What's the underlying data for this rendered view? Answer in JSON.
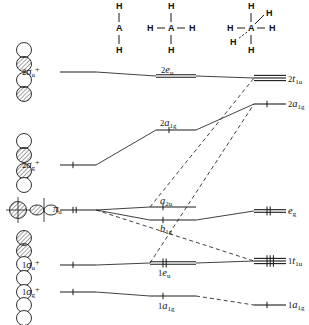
{
  "figure": {
    "type": "molecular-orbital-correlation-diagram"
  },
  "structures": [
    {
      "name": "linear-ah2",
      "center_atom": "A",
      "ligand": "H",
      "atoms": [
        "H",
        "A",
        "H"
      ],
      "x": 119,
      "y": 6,
      "geometry": "linear"
    },
    {
      "name": "square-planar-ah4",
      "center_atom": "A",
      "ligand": "H",
      "atoms": [
        "H",
        "H",
        "A",
        "H",
        "H"
      ],
      "x": 171,
      "y": 6,
      "geometry": "square-planar"
    },
    {
      "name": "tetrahedral-ah4",
      "center_atom": "A",
      "ligand": "H",
      "atoms": [
        "H",
        "H",
        "A",
        "H",
        "H"
      ],
      "x": 251,
      "y": 6,
      "geometry": "tetrahedral"
    }
  ],
  "columns": {
    "left": {
      "name": "linear",
      "x": 60,
      "line_start": 60,
      "line_end": 96
    },
    "middle": {
      "name": "square-planar",
      "x": 160,
      "line_start": 156,
      "line_end": 196
    },
    "right": {
      "name": "tetrahedral",
      "x": 258,
      "line_start": 254,
      "line_end": 286
    }
  },
  "levels": {
    "left": [
      {
        "label_pre": "2",
        "label_sym": "σ",
        "label_sub": "u",
        "label_sup": "+",
        "text": "2σu+",
        "y": 72,
        "x1": 60,
        "x2": 96,
        "lines": 1,
        "electrons": 0,
        "label_x": 22,
        "label_y": 66,
        "name": "level-2sigma-u-plus"
      },
      {
        "label_pre": "2",
        "label_sym": "σ",
        "label_sub": "g",
        "label_sup": "+",
        "text": "2σg+",
        "y": 165,
        "x1": 60,
        "x2": 96,
        "lines": 1,
        "electrons": 2,
        "label_x": 22,
        "label_y": 159,
        "name": "level-2sigma-g-plus"
      },
      {
        "label_pre": "",
        "label_sym": "π",
        "label_sub": "u",
        "label_sup": "",
        "text": "πu",
        "y": 210,
        "x1": 60,
        "x2": 96,
        "lines": 1,
        "electrons": 4,
        "label_x": 53,
        "label_y": 204,
        "name": "level-pi-u"
      },
      {
        "label_pre": "1",
        "label_sym": "σ",
        "label_sub": "u",
        "label_sup": "+",
        "text": "1σu+",
        "y": 265,
        "x1": 60,
        "x2": 96,
        "lines": 1,
        "electrons": 2,
        "label_x": 22,
        "label_y": 259,
        "name": "level-1sigma-u-plus"
      },
      {
        "label_pre": "1",
        "label_sym": "σ",
        "label_sub": "g",
        "label_sup": "+",
        "text": "1σg+",
        "y": 292,
        "x1": 60,
        "x2": 96,
        "lines": 1,
        "electrons": 2,
        "label_x": 22,
        "label_y": 286,
        "name": "level-1sigma-g-plus"
      }
    ],
    "middle": [
      {
        "label_pre": "2",
        "label_sym": "e",
        "label_sub": "u",
        "label_sup": "",
        "text": "2eu",
        "y": 76,
        "x1": 156,
        "x2": 196,
        "lines": 2,
        "electrons": 0,
        "label_x": 161,
        "label_y": 65,
        "name": "level-2eu"
      },
      {
        "label_pre": "2",
        "label_sym": "a",
        "label_sub": "1g",
        "label_sup": "",
        "text": "2a1g",
        "y": 130,
        "x1": 156,
        "x2": 196,
        "lines": 1,
        "electrons": 2,
        "label_x": 160,
        "label_y": 118,
        "name": "level-2a1g-middle"
      },
      {
        "label_pre": "",
        "label_sym": "a",
        "label_sub": "2u",
        "label_sup": "",
        "text": "a2u",
        "y": 207,
        "x1": 150,
        "x2": 196,
        "lines": 1,
        "electrons": 2,
        "label_x": 160,
        "label_y": 196,
        "name": "level-a2u"
      },
      {
        "label_pre": "",
        "label_sym": "b",
        "label_sub": "1g",
        "label_sup": "",
        "text": "b1g",
        "y": 220,
        "x1": 150,
        "x2": 196,
        "lines": 1,
        "electrons": 2,
        "label_x": 160,
        "label_y": 224,
        "name": "level-b1g"
      },
      {
        "label_pre": "1",
        "label_sym": "e",
        "label_sub": "u",
        "label_sup": "",
        "text": "1eu",
        "y": 263,
        "x1": 150,
        "x2": 196,
        "lines": 2,
        "electrons": 4,
        "label_x": 158,
        "label_y": 268,
        "name": "level-1eu"
      },
      {
        "label_pre": "1",
        "label_sym": "a",
        "label_sub": "1g",
        "label_sup": "",
        "text": "1a1g",
        "y": 296,
        "x1": 150,
        "x2": 196,
        "lines": 1,
        "electrons": 2,
        "label_x": 158,
        "label_y": 301,
        "name": "level-1a1g-middle"
      }
    ],
    "right": [
      {
        "label_pre": "2",
        "label_sym": "t",
        "label_sub": "1u",
        "label_sup": "",
        "text": "2t1u",
        "y": 78,
        "x1": 254,
        "x2": 286,
        "lines": 3,
        "electrons": 0,
        "label_x": 288,
        "label_y": 74,
        "name": "level-2t1u"
      },
      {
        "label_pre": "2",
        "label_sym": "a",
        "label_sub": "1g",
        "label_sup": "",
        "text": "2a1g",
        "y": 104,
        "x1": 254,
        "x2": 286,
        "lines": 1,
        "electrons": 2,
        "label_x": 288,
        "label_y": 99,
        "name": "level-2a1g-right"
      },
      {
        "label_pre": "",
        "label_sym": "e",
        "label_sub": "g",
        "label_sup": "",
        "text": "eg",
        "y": 211,
        "x1": 254,
        "x2": 286,
        "lines": 2,
        "electrons": 4,
        "label_x": 288,
        "label_y": 206,
        "name": "level-eg"
      },
      {
        "label_pre": "1",
        "label_sym": "t",
        "label_sub": "1u",
        "label_sup": "",
        "text": "1t1u",
        "y": 261,
        "x1": 254,
        "x2": 286,
        "lines": 3,
        "electrons": 6,
        "label_x": 288,
        "label_y": 256,
        "name": "level-1t1u"
      },
      {
        "label_pre": "1",
        "label_sym": "a",
        "label_sub": "1g",
        "label_sup": "",
        "text": "1a1g",
        "y": 305,
        "x1": 254,
        "x2": 286,
        "lines": 1,
        "electrons": 2,
        "label_x": 288,
        "label_y": 300,
        "name": "level-1a1g-right"
      }
    ]
  },
  "correlation_lines": [
    {
      "name": "corr-2sigmau-2eu",
      "x1": 96,
      "y1": 72,
      "x2": 156,
      "y2": 76,
      "style": "solid"
    },
    {
      "name": "corr-2eu-2t1u",
      "x1": 196,
      "y1": 76,
      "x2": 254,
      "y2": 78,
      "style": "solid"
    },
    {
      "name": "corr-2sigmag-2a1g-mid",
      "x1": 96,
      "y1": 165,
      "x2": 156,
      "y2": 130,
      "style": "solid"
    },
    {
      "name": "corr-2a1gmid-2a1gright",
      "x1": 196,
      "y1": 130,
      "x2": 254,
      "y2": 104,
      "style": "solid"
    },
    {
      "name": "corr-piu-a2u",
      "x1": 96,
      "y1": 210,
      "x2": 150,
      "y2": 207,
      "style": "solid"
    },
    {
      "name": "corr-piu-b1g",
      "x1": 96,
      "y1": 210,
      "x2": 150,
      "y2": 220,
      "style": "solid"
    },
    {
      "name": "corr-b1g-eg",
      "x1": 196,
      "y1": 220,
      "x2": 254,
      "y2": 211,
      "style": "solid"
    },
    {
      "name": "corr-piu-1t1u-dashed",
      "x1": 96,
      "y1": 210,
      "x2": 254,
      "y2": 261,
      "style": "dashed"
    },
    {
      "name": "corr-a2u-2t1u-dashed",
      "x1": 150,
      "y1": 207,
      "x2": 254,
      "y2": 78,
      "style": "dashed"
    },
    {
      "name": "corr-1eu-2a1g-dashed",
      "x1": 150,
      "y1": 263,
      "x2": 254,
      "y2": 104,
      "style": "dashed"
    },
    {
      "name": "corr-1sigmau-1eu",
      "x1": 96,
      "y1": 265,
      "x2": 150,
      "y2": 263,
      "style": "solid"
    },
    {
      "name": "corr-1eu-1t1u",
      "x1": 196,
      "y1": 263,
      "x2": 254,
      "y2": 261,
      "style": "solid"
    },
    {
      "name": "corr-1sigmag-1a1gmid",
      "x1": 96,
      "y1": 292,
      "x2": 150,
      "y2": 296,
      "style": "solid"
    },
    {
      "name": "corr-1a1gmid-1a1gright",
      "x1": 196,
      "y1": 296,
      "x2": 254,
      "y2": 305,
      "style": "dashed"
    }
  ],
  "orbital_pictograms": [
    {
      "name": "pictogram-2sigma-u",
      "kind": "sigma-antibonding-chain",
      "cx": 24,
      "cy": 72,
      "lobes": [
        {
          "r": 7.5,
          "dy": -22,
          "shaded": false
        },
        {
          "r": 7.5,
          "dy": -8,
          "shaded": true
        },
        {
          "r": 7.5,
          "dy": 8,
          "shaded": false
        },
        {
          "r": 7.5,
          "dy": 22,
          "shaded": true
        }
      ]
    },
    {
      "name": "pictogram-2sigma-g",
      "kind": "sigma-bonding-chain",
      "cx": 24,
      "cy": 163,
      "lobes": [
        {
          "r": 7.5,
          "dy": -22,
          "shaded": false
        },
        {
          "r": 7.5,
          "dy": -8,
          "shaded": true
        },
        {
          "r": 7.5,
          "dy": 8,
          "shaded": true
        },
        {
          "r": 7.5,
          "dy": 22,
          "shaded": false
        }
      ]
    },
    {
      "name": "pictogram-pi-u",
      "kind": "pi-pair",
      "cx": 18,
      "cy": 210,
      "lobes": []
    },
    {
      "name": "pictogram-1sigma-chain",
      "kind": "sigma-long-chain",
      "cx": 24,
      "cy": 278,
      "lobes": [
        {
          "r": 7.5,
          "dy": -40,
          "shaded": true
        },
        {
          "r": 7.5,
          "dy": -27,
          "shaded": true
        },
        {
          "r": 7.5,
          "dy": -14,
          "shaded": false
        },
        {
          "r": 7.5,
          "dy": 0,
          "shaded": false
        },
        {
          "r": 7.5,
          "dy": 14,
          "shaded": false
        },
        {
          "r": 7.5,
          "dy": 27,
          "shaded": false
        },
        {
          "r": 7.5,
          "dy": 40,
          "shaded": false
        }
      ]
    }
  ],
  "colors": {
    "ink": "#1a1a1a",
    "line": "#2b2b2b",
    "background": "#ffffff"
  }
}
